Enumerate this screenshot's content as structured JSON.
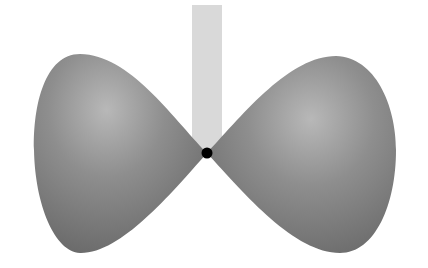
{
  "diagram": {
    "colors": {
      "background": "#ffffff",
      "lobe_dark": "#6e6e6e",
      "lobe_light": "#b4b4b4",
      "bar": "#d9d9d9",
      "node": "#000000"
    },
    "node": {
      "x": 207,
      "y": 153,
      "r": 5
    },
    "bar": {
      "x": 192,
      "y": 5,
      "width": 30,
      "height": 148
    },
    "lobes": [
      {
        "name": "left-lobe"
      },
      {
        "name": "right-lobe"
      }
    ]
  }
}
